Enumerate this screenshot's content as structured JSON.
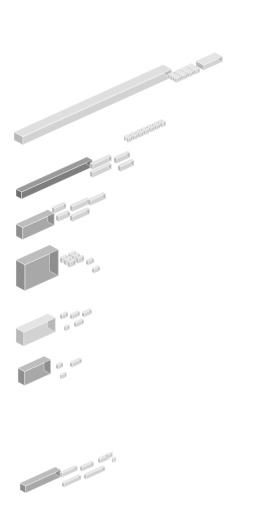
{
  "diagram": {
    "type": "isometric-block-decomposition",
    "background": "#ffffff",
    "colors": {
      "top_light": "#e4e4e4",
      "left_light": "#d2d2d2",
      "right_light": "#b8b8b8",
      "top_dark": "#9a9a9a",
      "left_dark": "#7e7e7e",
      "right_dark": "#6c6c6c",
      "top_mid": "#bdbdbd",
      "left_mid": "#a8a8a8",
      "right_mid": "#8e8e8e",
      "edge": "#f4f4f4"
    },
    "groups": [
      {
        "name": "long-slab",
        "row": 1,
        "shade": "light",
        "main": {
          "x": 14,
          "y": 140,
          "len": 160,
          "depth": 16,
          "h": 8
        },
        "pieces": 22
      },
      {
        "name": "dark-bar",
        "row": 2,
        "shade": "dark",
        "main": {
          "x": 16,
          "y": 190,
          "len": 76,
          "depth": 10,
          "h": 7
        },
        "pieces": 24
      },
      {
        "name": "tray-block",
        "row": 3,
        "shade": "mid",
        "main": {
          "x": 16,
          "y": 222,
          "len": 40,
          "depth": 12,
          "h": 12
        },
        "pieces": 6
      },
      {
        "name": "cube-block",
        "row": 4,
        "shade": "mid",
        "main": {
          "x": 16,
          "y": 268,
          "len": 40,
          "depth": 16,
          "h": 26
        },
        "pieces": 9
      },
      {
        "name": "box-block",
        "row": 5,
        "shade": "light",
        "main": {
          "x": 16,
          "y": 326,
          "len": 36,
          "depth": 14,
          "h": 14
        },
        "pieces": 6
      },
      {
        "name": "small-box-block",
        "row": 6,
        "shade": "mid",
        "main": {
          "x": 18,
          "y": 366,
          "len": 30,
          "depth": 12,
          "h": 14
        },
        "pieces": 4
      },
      {
        "name": "base-bar",
        "row": 7,
        "shade": "mid",
        "main": {
          "x": 20,
          "y": 484,
          "len": 36,
          "depth": 10,
          "h": 7
        },
        "pieces": 10
      }
    ]
  }
}
